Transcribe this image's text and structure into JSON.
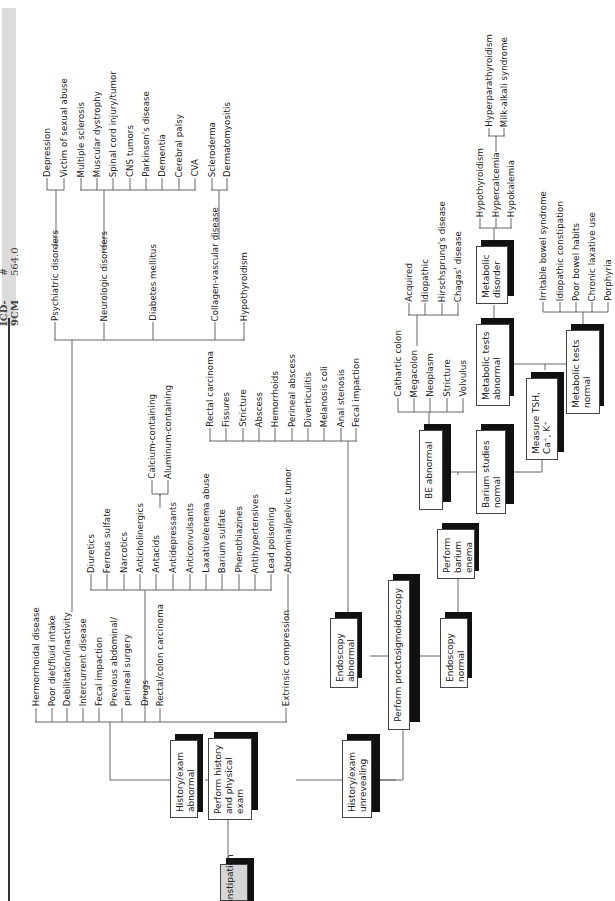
{
  "header": {
    "code_label": "ICD-9CM",
    "code_value": "# 564.0"
  },
  "boxes": {
    "constipation": "Constipation",
    "history_physical": "Perform history and physical exam",
    "history_abnormal": "History/exam abnormal",
    "history_unrevealing": "History/exam unrevealing",
    "proctosigmoidoscopy": "Perform proctosigmoidoscopy",
    "endoscopy_abnormal": "Endoscopy abnormal",
    "endoscopy_normal": "Endoscopy normal",
    "barium_enema": "Perform barium enema",
    "be_abnormal": "BE abnormal",
    "barium_normal": "Barium studies normal",
    "measure_tsh": "Measure TSH, Ca⁺, K⁺",
    "metabolic_abnormal": "Metabolic tests abnormal",
    "metabolic_normal": "Metabolic tests normal",
    "metabolic_disorder": "Metabolic disorder"
  },
  "history_causes": [
    "Hermorrhoidal disease",
    "Poor diet/fluid intake",
    "Debilitation/inactivity",
    "Intercurrent disease",
    "Fecal impaction",
    "Previous abdominal/",
    "perineal surgery",
    "Drugs",
    "Rectal/colon carcinoma",
    "Extrinsic compression"
  ],
  "systemic": [
    "Psychiatric disorders",
    "Neurologic disorders",
    "Diabetes mellitus",
    "Collagen-vascular disease",
    "Hypothyroidism"
  ],
  "psychiatric": [
    "Depression",
    "Victim of sexual abuse"
  ],
  "neurologic": [
    "Multiple sclerosis",
    "Muscular dystrophy",
    "Spinal cord injury/tumor",
    "CNS tumors",
    "Parkinson's disease",
    "Dementia",
    "Cerebral palsy",
    "CVA"
  ],
  "collagen": [
    "Scleroderma",
    "Dermatomyositis"
  ],
  "drugs": [
    "Diuretics",
    "Ferrous sulfate",
    "Narcotics",
    "Anticholinergics",
    "Antacids",
    "Antidepressants",
    "Anticonvulsants",
    "Laxative/enema abuse",
    "Barium sulfate",
    "Phenothiazines",
    "Antihypertensives",
    "Lead poisoning"
  ],
  "antacids": [
    "Calcium-containing",
    "Aluminum-containing"
  ],
  "extrinsic": [
    "Abdominal/pelvic tumor"
  ],
  "endoscopy_findings": [
    "Rectal carcinoma",
    "Fissures",
    "Stricture",
    "Abscess",
    "Hemorrhoids",
    "Perineal abscess",
    "Diverticulitis",
    "Melanosis coli",
    "Anal stenosis",
    "Fecal impaction"
  ],
  "be_findings": [
    "Cathartic colon",
    "Megacolon",
    "Neoplasm",
    "Stricture",
    "Volvulus"
  ],
  "megacolon": [
    "Acquired",
    "Idiopathic",
    "Hirschsprung's disease",
    "Chagas' disease"
  ],
  "metabolic_disorders": [
    "Hypothyroidism",
    "Hypercalcemia",
    "Hypokalemia"
  ],
  "hypercalcemia": [
    "Hyperparathyroidism",
    "Milk-alkali syndrome"
  ],
  "normal_causes": [
    "Irritable bowel syndrome",
    "Idiopathic constipation",
    "Poor bowel habits",
    "Chronic laxative use",
    "Porphyria"
  ]
}
